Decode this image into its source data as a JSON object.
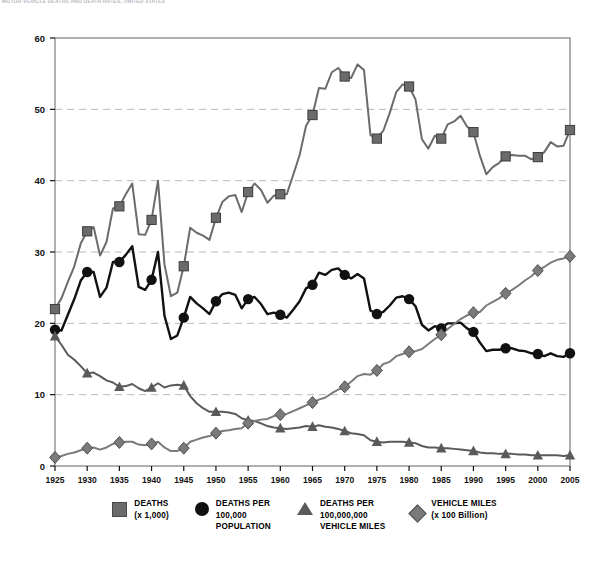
{
  "title": "MOTOR VEHICLE DEATHS AND DEATH RATES, UNITED STATES",
  "axes": {
    "y_ticks": [
      "0",
      "10",
      "20",
      "30",
      "40",
      "50",
      "60"
    ],
    "x_ticks": [
      "1925",
      "1930",
      "1935",
      "1940",
      "1945",
      "1950",
      "1955",
      "1960",
      "1965",
      "1970",
      "1975",
      "1980",
      "1985",
      "1990",
      "1995",
      "2000",
      "2005"
    ]
  },
  "legend": {
    "items": [
      {
        "label": "DEATHS\n(x 1,000)",
        "marker": "square-marker",
        "color": "#6b6b6b"
      },
      {
        "label": "DEATHS PER\n100,000\nPOPULATION",
        "marker": "circle-marker",
        "color": "#111111"
      },
      {
        "label": "DEATHS PER\n100,000,000\nVEHICLE MILES",
        "marker": "triangle-marker",
        "color": "#5a5a5a"
      },
      {
        "label": "VEHICLE MILES\n(x 100 Billion)",
        "marker": "diamond-marker",
        "color": "#7a7a7a"
      }
    ]
  },
  "chart_data": {
    "type": "line",
    "title": "MOTOR VEHICLE DEATHS AND DEATH RATES, UNITED STATES",
    "xlabel": "",
    "ylabel": "",
    "xlim": [
      1925,
      2005
    ],
    "ylim": [
      0,
      60
    ],
    "grid": true,
    "legend_position": "bottom",
    "x": [
      1925,
      1926,
      1927,
      1928,
      1929,
      1930,
      1931,
      1932,
      1933,
      1934,
      1935,
      1936,
      1937,
      1938,
      1939,
      1940,
      1941,
      1942,
      1943,
      1944,
      1945,
      1946,
      1947,
      1948,
      1949,
      1950,
      1951,
      1952,
      1953,
      1954,
      1955,
      1956,
      1957,
      1958,
      1959,
      1960,
      1961,
      1962,
      1963,
      1964,
      1965,
      1966,
      1967,
      1968,
      1969,
      1970,
      1971,
      1972,
      1973,
      1974,
      1975,
      1976,
      1977,
      1978,
      1979,
      1980,
      1981,
      1982,
      1983,
      1984,
      1985,
      1986,
      1987,
      1988,
      1989,
      1990,
      1991,
      1992,
      1993,
      1994,
      1995,
      1996,
      1997,
      1998,
      1999,
      2000,
      2001,
      2002,
      2003,
      2004,
      2005
    ],
    "series": [
      {
        "name": "DEATHS (x 1,000)",
        "marker": "square",
        "color": "#6b6b6b",
        "marker_years": [
          1925,
          1930,
          1935,
          1940,
          1945,
          1950,
          1955,
          1960,
          1965,
          1970,
          1975,
          1980,
          1985,
          1990,
          1995,
          2000,
          2005
        ],
        "values": [
          22.0,
          23.5,
          25.8,
          28.0,
          31.2,
          32.9,
          33.5,
          29.5,
          31.4,
          36.1,
          36.4,
          38.1,
          39.6,
          32.5,
          32.4,
          34.5,
          40.0,
          28.3,
          23.8,
          24.3,
          28.0,
          33.4,
          32.7,
          32.3,
          31.7,
          34.8,
          37.0,
          37.8,
          38.0,
          35.6,
          38.4,
          39.6,
          38.7,
          36.9,
          37.9,
          38.1,
          38.1,
          40.8,
          43.6,
          47.7,
          49.2,
          53.0,
          52.9,
          55.2,
          55.8,
          54.6,
          54.4,
          56.3,
          55.5,
          46.4,
          45.9,
          47.0,
          49.5,
          52.4,
          53.5,
          53.2,
          51.4,
          45.8,
          44.5,
          46.3,
          45.9,
          47.9,
          48.3,
          49.1,
          47.6,
          46.8,
          43.5,
          40.9,
          41.9,
          42.5,
          43.4,
          43.6,
          43.5,
          43.5,
          43.0,
          43.3,
          44.0,
          45.4,
          44.8,
          44.9,
          47.1
        ]
      },
      {
        "name": "DEATHS PER 100,000 POPULATION",
        "marker": "circle",
        "color": "#111111",
        "marker_years": [
          1925,
          1930,
          1935,
          1940,
          1945,
          1950,
          1955,
          1960,
          1965,
          1970,
          1975,
          1980,
          1985,
          1990,
          1995,
          2000,
          2005
        ],
        "values": [
          19.1,
          19.0,
          21.2,
          23.4,
          26.0,
          27.2,
          27.2,
          23.7,
          25.0,
          28.6,
          28.6,
          29.6,
          30.8,
          25.1,
          24.7,
          26.1,
          30.0,
          21.1,
          17.8,
          18.3,
          20.8,
          23.7,
          22.8,
          22.1,
          21.3,
          23.1,
          24.1,
          24.3,
          24.0,
          22.1,
          23.4,
          23.7,
          22.7,
          21.3,
          21.5,
          21.2,
          20.8,
          21.9,
          23.1,
          24.9,
          25.4,
          27.1,
          26.8,
          27.5,
          27.7,
          26.8,
          26.3,
          26.9,
          26.3,
          21.8,
          21.3,
          21.6,
          22.5,
          23.6,
          23.8,
          23.4,
          22.4,
          19.8,
          19.0,
          19.6,
          19.3,
          20.0,
          20.0,
          20.1,
          19.3,
          18.8,
          17.3,
          16.1,
          16.3,
          16.3,
          16.5,
          16.5,
          16.2,
          16.1,
          15.8,
          15.7,
          15.4,
          15.8,
          15.4,
          15.3,
          15.8
        ]
      },
      {
        "name": "DEATHS PER 100,000,000 VEHICLE MILES",
        "marker": "triangle",
        "color": "#5a5a5a",
        "marker_years": [
          1925,
          1930,
          1935,
          1940,
          1945,
          1950,
          1955,
          1960,
          1965,
          1970,
          1975,
          1980,
          1985,
          1990,
          1995,
          2000,
          2005
        ],
        "values": [
          18.2,
          17.0,
          15.6,
          14.9,
          14.0,
          13.0,
          13.1,
          12.6,
          12.0,
          11.7,
          11.1,
          11.2,
          11.5,
          10.9,
          10.5,
          11.0,
          11.6,
          11.0,
          11.3,
          11.4,
          11.3,
          9.8,
          8.8,
          8.1,
          7.6,
          7.6,
          7.6,
          7.5,
          7.3,
          6.7,
          6.4,
          6.3,
          5.98,
          5.6,
          5.4,
          5.3,
          5.2,
          5.3,
          5.4,
          5.6,
          5.5,
          5.7,
          5.5,
          5.4,
          5.2,
          4.9,
          4.6,
          4.5,
          4.3,
          3.6,
          3.4,
          3.3,
          3.4,
          3.4,
          3.4,
          3.3,
          3.2,
          2.8,
          2.6,
          2.6,
          2.5,
          2.5,
          2.4,
          2.3,
          2.2,
          2.1,
          1.9,
          1.8,
          1.8,
          1.7,
          1.7,
          1.7,
          1.6,
          1.6,
          1.5,
          1.5,
          1.5,
          1.5,
          1.5,
          1.4,
          1.5
        ]
      },
      {
        "name": "VEHICLE MILES (x 100 Billion)",
        "marker": "diamond",
        "color": "#7a7a7a",
        "marker_years": [
          1925,
          1930,
          1935,
          1940,
          1945,
          1950,
          1955,
          1960,
          1965,
          1970,
          1975,
          1980,
          1985,
          1990,
          1995,
          2000,
          2005
        ],
        "values": [
          1.2,
          1.4,
          1.7,
          1.9,
          2.2,
          2.5,
          2.6,
          2.3,
          2.6,
          3.1,
          3.3,
          3.4,
          3.4,
          3.0,
          2.9,
          3.1,
          3.4,
          2.6,
          2.1,
          2.1,
          2.5,
          3.4,
          3.7,
          4.0,
          4.2,
          4.6,
          4.9,
          5.0,
          5.2,
          5.3,
          6.0,
          6.3,
          6.5,
          6.6,
          7.0,
          7.2,
          7.3,
          7.7,
          8.1,
          8.5,
          8.9,
          9.3,
          9.6,
          10.2,
          10.7,
          11.1,
          11.8,
          12.6,
          12.9,
          12.8,
          13.4,
          14.3,
          14.6,
          15.4,
          15.7,
          16.0,
          16.1,
          16.4,
          17.1,
          17.8,
          18.4,
          19.2,
          19.9,
          20.6,
          21.1,
          21.5,
          21.6,
          22.5,
          23.0,
          23.5,
          24.2,
          24.7,
          25.3,
          26.0,
          26.6,
          27.4,
          27.9,
          28.5,
          28.9,
          29.1,
          29.4
        ]
      }
    ]
  }
}
